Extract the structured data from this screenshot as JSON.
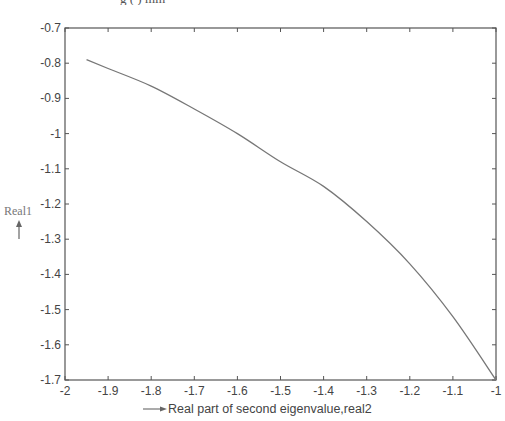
{
  "caption_fragment": "g  ( )        min",
  "chart_data": {
    "type": "line",
    "title": "",
    "xlabel": "Real part of second eigenvalue,real2",
    "ylabel": "Real1",
    "xlim": [
      -2,
      -1
    ],
    "ylim": [
      -1.7,
      -0.7
    ],
    "grid": false,
    "legend": null,
    "x_ticks": [
      -2,
      -1.9,
      -1.8,
      -1.7,
      -1.6,
      -1.5,
      -1.4,
      -1.3,
      -1.2,
      -1.1,
      -1
    ],
    "x_tick_labels": [
      "-2",
      "-1.9",
      "-1.8",
      "-1.7",
      "-1.6",
      "-1.5",
      "-1.4",
      "-1.3",
      "-1.2",
      "-1.1",
      "-1"
    ],
    "y_ticks": [
      -0.7,
      -0.8,
      -0.9,
      -1,
      -1.1,
      -1.2,
      -1.3,
      -1.4,
      -1.5,
      -1.6,
      -1.7
    ],
    "y_tick_labels": [
      "-0.7",
      "-0.8",
      "-0.9",
      "-1",
      "-1.1",
      "-1.2",
      "-1.3",
      "-1.4",
      "-1.5",
      "-1.6",
      "-1.7"
    ],
    "series": [
      {
        "name": "real1 vs real2",
        "color": "#777777",
        "x": [
          -1.95,
          -1.9,
          -1.8,
          -1.7,
          -1.6,
          -1.5,
          -1.4,
          -1.3,
          -1.2,
          -1.1,
          -1.0
        ],
        "y": [
          -0.79,
          -0.815,
          -0.865,
          -0.93,
          -1.0,
          -1.08,
          -1.15,
          -1.25,
          -1.37,
          -1.52,
          -1.7
        ]
      }
    ]
  }
}
